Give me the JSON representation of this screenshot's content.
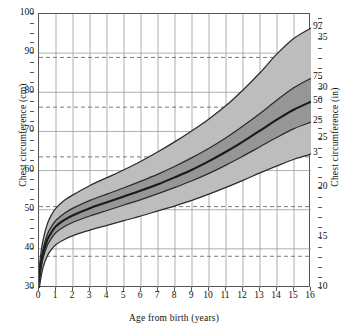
{
  "chart_data": {
    "type": "line",
    "title": "",
    "xlabel": "Age from birth (years)",
    "ylabel": "Chest circumference (cm)",
    "ylabel_secondary": "Chest circumference (in)",
    "xlim": [
      0,
      16
    ],
    "ylim": [
      30,
      100
    ],
    "ylim_secondary": [
      10,
      37.5
    ],
    "grid": true,
    "legend_position": "right-edge-inline",
    "x_ticks": [
      "0",
      "1",
      "2",
      "3",
      "4",
      "5",
      "6",
      "7",
      "8",
      "9",
      "10",
      "11",
      "12",
      "13",
      "14",
      "15",
      "16"
    ],
    "y_ticks_left": [
      "30",
      "40",
      "50",
      "60",
      "70",
      "80",
      "90",
      "100"
    ],
    "y_ticks_right": [
      "10",
      "15",
      "20",
      "25",
      "30",
      "35"
    ],
    "y_dashed_cm": [
      38.1,
      50.8,
      63.5,
      76.2,
      88.9
    ],
    "x": [
      0,
      0.1,
      0.25,
      0.5,
      0.75,
      1,
      1.5,
      2,
      3,
      4,
      5,
      6,
      7,
      8,
      9,
      10,
      11,
      12,
      13,
      14,
      15,
      16
    ],
    "series": [
      {
        "name": "97",
        "label": "97",
        "values": [
          34.5,
          38.5,
          42.5,
          46.5,
          48.8,
          50.4,
          52.4,
          53.8,
          56.2,
          58.2,
          60.2,
          62.4,
          64.8,
          67.4,
          70.2,
          73.2,
          76.6,
          80.6,
          85.0,
          89.8,
          93.8,
          96.4
        ]
      },
      {
        "name": "75",
        "label": "75",
        "values": [
          32.6,
          36.4,
          40.2,
          43.8,
          45.8,
          47.3,
          49.1,
          50.4,
          52.4,
          54.0,
          55.6,
          57.3,
          59.1,
          61.1,
          63.3,
          65.7,
          68.4,
          71.4,
          74.6,
          78.0,
          81.2,
          83.6
        ]
      },
      {
        "name": "50",
        "label": "50",
        "values": [
          31.8,
          35.4,
          39.0,
          42.4,
          44.3,
          45.8,
          47.4,
          48.6,
          50.4,
          51.9,
          53.4,
          54.9,
          56.5,
          58.3,
          60.2,
          62.4,
          64.8,
          67.4,
          70.2,
          73.0,
          75.6,
          77.6
        ]
      },
      {
        "name": "25",
        "label": "25",
        "values": [
          31.0,
          34.4,
          37.8,
          41.0,
          42.8,
          44.2,
          45.7,
          46.8,
          48.4,
          49.8,
          51.2,
          52.6,
          54.1,
          55.7,
          57.4,
          59.3,
          61.4,
          63.7,
          66.1,
          68.5,
          70.7,
          72.4
        ]
      },
      {
        "name": "3",
        "label": "3",
        "values": [
          29.2,
          32.3,
          35.4,
          38.3,
          39.9,
          41.1,
          42.4,
          43.4,
          44.8,
          46.0,
          47.2,
          48.4,
          49.7,
          51.0,
          52.4,
          54.0,
          55.7,
          57.5,
          59.4,
          61.2,
          62.9,
          64.2
        ]
      }
    ],
    "bands": [
      {
        "name": "3-97-band",
        "lower": "3",
        "upper": "97",
        "color": "#bdbdbd"
      },
      {
        "name": "25-75-band",
        "lower": "25",
        "upper": "75",
        "color": "#969696"
      }
    ],
    "colors": {
      "outer_band": "#bdbdbd",
      "inner_band": "#969696",
      "curve_line": "#2b2b2b",
      "median_line": "#1a1a1a",
      "grid_line": "#9a9a9a",
      "dashed_line": "#6d6d6d",
      "axis": "#555555",
      "text": "#111111",
      "background": "#ffffff"
    }
  }
}
